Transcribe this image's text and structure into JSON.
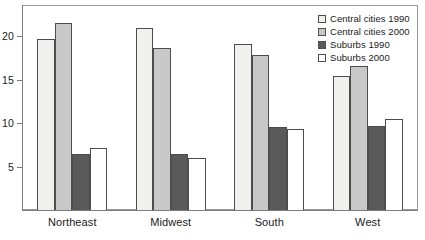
{
  "chart_data": {
    "type": "bar",
    "title": "",
    "subtitle": "",
    "xlabel": "",
    "ylabel": "",
    "categories": [
      "Northeast",
      "Midwest",
      "South",
      "West"
    ],
    "series": [
      {
        "name": "Central cities 1990",
        "color": "#f0f0ee",
        "values": [
          19.7,
          21.0,
          19.1,
          15.4
        ]
      },
      {
        "name": "Central cities 2000",
        "color": "#c8c8c8",
        "values": [
          21.5,
          18.7,
          17.8,
          16.6
        ]
      },
      {
        "name": "Suburbs 1990",
        "color": "#5a5a5a",
        "values": [
          6.4,
          6.5,
          9.6,
          9.7
        ]
      },
      {
        "name": "Suburbs 2000",
        "color": "#ffffff",
        "values": [
          7.1,
          6.0,
          9.3,
          10.5
        ]
      }
    ],
    "ylim": [
      0,
      23.5
    ],
    "yticks": [
      5,
      10,
      15,
      20
    ],
    "ytick_labels": [
      "5",
      "10",
      "15",
      "20"
    ],
    "grid": false,
    "legend_position": "top-right",
    "bar_outline_color": "#4d4d4d",
    "axis_color": "#7d7d7d"
  },
  "legend": {
    "entries": [
      "Central cities 1990",
      "Central cities 2000",
      "Suburbs 1990",
      "Suburbs 2000"
    ]
  }
}
